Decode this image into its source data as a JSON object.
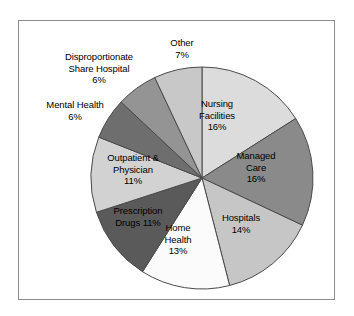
{
  "figure": {
    "frame_color": "#8c8c8c",
    "background": "#ffffff"
  },
  "chart_data": {
    "type": "pie",
    "title": "",
    "subtitle": "",
    "xlabel": "",
    "ylabel": "",
    "legend_position": "none",
    "grid": false,
    "labels_inside": true,
    "units": "percent",
    "total": 100,
    "categories": [
      "Nursing Facilities",
      "Managed Care",
      "Hospitals",
      "Home Health",
      "Prescription Drugs",
      "Outpatient & Physician",
      "Mental Health",
      "Disproportionate Share Hospital",
      "Other"
    ],
    "values": [
      16,
      16,
      14,
      13,
      11,
      11,
      6,
      6,
      7
    ],
    "value_labels": [
      "16%",
      "16%",
      "14%",
      "13%",
      "11%",
      "11%",
      "6%",
      "6%",
      "7%"
    ],
    "colors": [
      "#dcdcdc",
      "#8a8a8a",
      "#c6c6c6",
      "#fbfbfb",
      "#5a5a5a",
      "#d2d2d2",
      "#6e6e6e",
      "#949494",
      "#c8c8c8"
    ],
    "slices": [
      {
        "label": "Nursing Facilities",
        "value": 16,
        "value_label": "16%",
        "color": "#dcdcdc",
        "label_text": "Nursing\nFacilities\n16%",
        "label_placement": "inside"
      },
      {
        "label": "Managed Care",
        "value": 16,
        "value_label": "16%",
        "color": "#8a8a8a",
        "label_text": "Managed\nCare\n16%",
        "label_placement": "inside"
      },
      {
        "label": "Hospitals",
        "value": 14,
        "value_label": "14%",
        "color": "#c6c6c6",
        "label_text": "Hospitals\n14%",
        "label_placement": "inside"
      },
      {
        "label": "Home Health",
        "value": 13,
        "value_label": "13%",
        "color": "#fbfbfb",
        "label_text": "Home\nHealth\n13%",
        "label_placement": "inside"
      },
      {
        "label": "Prescription Drugs",
        "value": 11,
        "value_label": "11%",
        "color": "#5a5a5a",
        "label_text": "Prescription\nDrugs 11%",
        "label_placement": "inside"
      },
      {
        "label": "Outpatient & Physician",
        "value": 11,
        "value_label": "11%",
        "color": "#d2d2d2",
        "label_text": "Outpatient &\nPhysician\n11%",
        "label_placement": "inside"
      },
      {
        "label": "Mental Health",
        "value": 6,
        "value_label": "6%",
        "color": "#6e6e6e",
        "label_text": "Mental Health\n6%",
        "label_placement": "outside"
      },
      {
        "label": "Disproportionate Share Hospital",
        "value": 6,
        "value_label": "6%",
        "color": "#949494",
        "label_text": "Disproportionate\nShare Hospital\n6%",
        "label_placement": "outside"
      },
      {
        "label": "Other",
        "value": 7,
        "value_label": "7%",
        "color": "#c8c8c8",
        "label_text": "Other\n7%",
        "label_placement": "outside"
      }
    ]
  }
}
